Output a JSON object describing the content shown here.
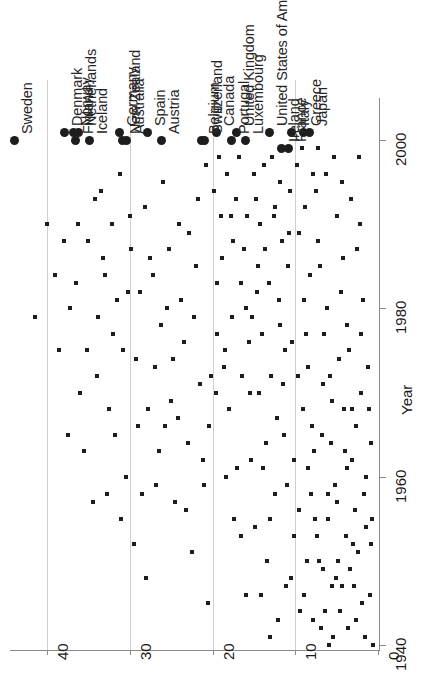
{
  "chart_data": {
    "type": "scatter",
    "title": "",
    "xlabel": "Year",
    "ylabel": "",
    "orientation": "rotated-90",
    "grid": true,
    "legend": null,
    "axes": {
      "value_axis": {
        "name": "value",
        "ticks": [
          "40",
          "30",
          "20",
          "10",
          "0"
        ],
        "tick_values": [
          40,
          30,
          20,
          10,
          0
        ],
        "range": [
          0,
          44
        ]
      },
      "year_axis": {
        "name": "Year",
        "label": "Year",
        "ticks": [
          "2000",
          "1940",
          "1960",
          "1980"
        ],
        "tick_values": [
          1940,
          1960,
          1980,
          2000
        ],
        "range": [
          1936,
          2005
        ]
      }
    },
    "marker_styles": {
      "historical": "small-square",
      "latest": "large-filled-circle"
    },
    "labeled_points": [
      {
        "label": "Sweden",
        "value": 44.0,
        "year": 2000
      },
      {
        "label": "Denmark",
        "value": 38.0,
        "year": 2001
      },
      {
        "label": "Norway",
        "value": 36.8,
        "year": 2001
      },
      {
        "label": "Netherlands",
        "value": 36.2,
        "year": 2001
      },
      {
        "label": "Finland",
        "value": 36.6,
        "year": 2000
      },
      {
        "label": "Iceland",
        "value": 34.9,
        "year": 2000
      },
      {
        "label": "Germany",
        "value": 31.3,
        "year": 2001
      },
      {
        "label": "New Zealand",
        "value": 30.9,
        "year": 2000
      },
      {
        "label": "Australia",
        "value": 30.5,
        "year": 2000
      },
      {
        "label": "Spain",
        "value": 27.9,
        "year": 2001
      },
      {
        "label": "Austria",
        "value": 26.2,
        "year": 2000
      },
      {
        "label": "Belgium",
        "value": 21.4,
        "year": 2000
      },
      {
        "label": "Switzerland",
        "value": 21.0,
        "year": 2000
      },
      {
        "label": "Canada",
        "value": 19.6,
        "year": 2001
      },
      {
        "label": "Portugal",
        "value": 17.8,
        "year": 2000
      },
      {
        "label": "United Kingdom",
        "value": 17.2,
        "year": 2001
      },
      {
        "label": "Luxembourg",
        "value": 16.1,
        "year": 2000
      },
      {
        "label": "United States of America",
        "value": 13.2,
        "year": 2001
      },
      {
        "label": "Ireland",
        "value": 11.7,
        "year": 1999
      },
      {
        "label": "France",
        "value": 10.9,
        "year": 1999
      },
      {
        "label": "Italy",
        "value": 10.5,
        "year": 2001
      },
      {
        "label": "Greece",
        "value": 9.1,
        "year": 2001
      },
      {
        "label": "Japan",
        "value": 8.3,
        "year": 2001
      }
    ],
    "historical_points": [
      [
        41.5,
        1979
      ],
      [
        38.5,
        1975
      ],
      [
        37.5,
        1965
      ],
      [
        36.0,
        1970
      ],
      [
        35.5,
        1963
      ],
      [
        34.5,
        1957
      ],
      [
        33.0,
        1984
      ],
      [
        32.5,
        1968
      ],
      [
        31.5,
        1981
      ],
      [
        30.5,
        1960
      ],
      [
        29.5,
        1952
      ],
      [
        38.0,
        1988
      ],
      [
        36.5,
        1983
      ],
      [
        35.0,
        1988
      ],
      [
        34.0,
        1972
      ],
      [
        33.5,
        1994
      ],
      [
        32.0,
        1977
      ],
      [
        31.0,
        1955
      ],
      [
        30.0,
        1991
      ],
      [
        29.0,
        1966
      ],
      [
        28.5,
        1958
      ],
      [
        28.0,
        1948
      ],
      [
        27.5,
        1986
      ],
      [
        27.0,
        1973
      ],
      [
        26.5,
        1963
      ],
      [
        26.0,
        1995
      ],
      [
        25.5,
        1980
      ],
      [
        25.0,
        1969
      ],
      [
        24.5,
        1957
      ],
      [
        24.0,
        1990
      ],
      [
        23.5,
        1976
      ],
      [
        23.0,
        1964
      ],
      [
        22.5,
        1951
      ],
      [
        22.0,
        1985
      ],
      [
        21.5,
        1971
      ],
      [
        21.0,
        1959
      ],
      [
        20.5,
        1945
      ],
      [
        34.2,
        1993
      ],
      [
        33.2,
        1986
      ],
      [
        32.2,
        1990
      ],
      [
        31.2,
        1996
      ],
      [
        30.2,
        1982
      ],
      [
        29.2,
        1974
      ],
      [
        28.2,
        1992
      ],
      [
        27.2,
        1984
      ],
      [
        26.2,
        1978
      ],
      [
        25.2,
        1987
      ],
      [
        24.2,
        1967
      ],
      [
        23.2,
        1956
      ],
      [
        22.2,
        1979
      ],
      [
        21.2,
        1962
      ],
      [
        20.2,
        1972
      ],
      [
        19.8,
        1994
      ],
      [
        19.5,
        1983
      ],
      [
        19.0,
        1991
      ],
      [
        18.5,
        1975
      ],
      [
        18.0,
        1968
      ],
      [
        17.5,
        1988
      ],
      [
        17.0,
        1961
      ],
      [
        16.5,
        1953
      ],
      [
        16.0,
        1980
      ],
      [
        15.5,
        1970
      ],
      [
        15.0,
        1996
      ],
      [
        14.5,
        1985
      ],
      [
        14.0,
        1977
      ],
      [
        13.5,
        1964
      ],
      [
        13.0,
        1955
      ],
      [
        12.5,
        1992
      ],
      [
        12.0,
        1981
      ],
      [
        11.5,
        1971
      ],
      [
        11.0,
        1959
      ],
      [
        10.5,
        1948
      ],
      [
        19.2,
        1998
      ],
      [
        18.2,
        1996
      ],
      [
        17.2,
        1993
      ],
      [
        16.2,
        1987
      ],
      [
        15.2,
        1979
      ],
      [
        14.2,
        1990
      ],
      [
        13.2,
        1983
      ],
      [
        12.2,
        1967
      ],
      [
        11.2,
        1975
      ],
      [
        10.2,
        1962
      ],
      [
        9.8,
        1997
      ],
      [
        9.5,
        1989
      ],
      [
        9.0,
        1981
      ],
      [
        8.5,
        1973
      ],
      [
        8.0,
        1966
      ],
      [
        7.5,
        1994
      ],
      [
        7.0,
        1985
      ],
      [
        6.5,
        1977
      ],
      [
        6.0,
        1958
      ],
      [
        5.5,
        1969
      ],
      [
        5.0,
        1991
      ],
      [
        4.5,
        1982
      ],
      [
        4.0,
        1963
      ],
      [
        3.5,
        1975
      ],
      [
        3.0,
        1952
      ],
      [
        2.5,
        1987
      ],
      [
        2.0,
        1970
      ],
      [
        1.5,
        1960
      ],
      [
        1.0,
        1946
      ],
      [
        9.2,
        1999
      ],
      [
        8.8,
        1992
      ],
      [
        8.2,
        1984
      ],
      [
        7.8,
        1996
      ],
      [
        7.2,
        1988
      ],
      [
        6.8,
        1965
      ],
      [
        6.2,
        1980
      ],
      [
        5.8,
        1972
      ],
      [
        5.2,
        1959
      ],
      [
        4.8,
        1950
      ],
      [
        4.2,
        1986
      ],
      [
        3.8,
        1978
      ],
      [
        3.2,
        1968
      ],
      [
        2.8,
        1956
      ],
      [
        2.2,
        1990
      ],
      [
        1.8,
        1981
      ],
      [
        1.2,
        1973
      ],
      [
        0.8,
        1964
      ],
      [
        9.6,
        1956
      ],
      [
        8.6,
        1950
      ],
      [
        7.6,
        1955
      ],
      [
        6.6,
        1949
      ],
      [
        5.6,
        1947
      ],
      [
        4.6,
        1944
      ],
      [
        3.6,
        1942
      ],
      [
        2.6,
        1943
      ],
      [
        1.6,
        1941
      ],
      [
        0.6,
        1940
      ],
      [
        8.4,
        1961
      ],
      [
        7.4,
        1953
      ],
      [
        6.4,
        1944
      ],
      [
        5.4,
        1941
      ],
      [
        4.4,
        1947
      ],
      [
        3.4,
        1949
      ],
      [
        2.4,
        1951
      ],
      [
        1.4,
        1954
      ],
      [
        9.4,
        1944
      ],
      [
        8.9,
        1946
      ],
      [
        7.9,
        1943
      ],
      [
        6.9,
        1942
      ],
      [
        5.9,
        1940
      ],
      [
        4.9,
        1957
      ],
      [
        3.9,
        1953
      ],
      [
        2.9,
        1947
      ],
      [
        1.9,
        1945
      ],
      [
        12.8,
        1998
      ],
      [
        11.8,
        1995
      ],
      [
        10.8,
        1989
      ],
      [
        13.8,
        1997
      ],
      [
        14.8,
        1993
      ],
      [
        15.8,
        1991
      ],
      [
        16.8,
        1998
      ],
      [
        17.8,
        1991
      ],
      [
        18.8,
        1986
      ],
      [
        20.8,
        1997
      ],
      [
        21.8,
        1993
      ],
      [
        22.8,
        1989
      ],
      [
        23.8,
        1981
      ],
      [
        24.8,
        1974
      ],
      [
        25.8,
        1966
      ],
      [
        26.8,
        1959
      ],
      [
        27.8,
        1968
      ],
      [
        28.8,
        1982
      ],
      [
        29.8,
        1987
      ],
      [
        30.8,
        1975
      ],
      [
        31.8,
        1965
      ],
      [
        32.8,
        1958
      ],
      [
        33.8,
        1979
      ],
      [
        35.2,
        1975
      ],
      [
        36.2,
        1990
      ],
      [
        37.2,
        1980
      ],
      [
        39.0,
        1984
      ],
      [
        40.0,
        1990
      ],
      [
        10.4,
        1976
      ],
      [
        11.4,
        1965
      ],
      [
        12.4,
        1958
      ],
      [
        13.4,
        1950
      ],
      [
        14.4,
        1970
      ],
      [
        15.4,
        1962
      ],
      [
        16.4,
        1972
      ],
      [
        17.4,
        1955
      ],
      [
        18.4,
        1960
      ],
      [
        19.4,
        1977
      ],
      [
        20.4,
        1966
      ],
      [
        9.1,
        1968
      ],
      [
        8.1,
        1958
      ],
      [
        7.1,
        1950
      ],
      [
        6.1,
        1955
      ],
      [
        5.1,
        1948
      ],
      [
        4.1,
        1968
      ],
      [
        3.1,
        1962
      ],
      [
        2.1,
        1977
      ],
      [
        1.1,
        1968
      ],
      [
        0.9,
        1952
      ],
      [
        10.1,
        1953
      ],
      [
        11.1,
        1947
      ],
      [
        12.1,
        1943
      ],
      [
        13.1,
        1941
      ],
      [
        14.1,
        1946
      ],
      [
        10.9,
        1985
      ],
      [
        11.9,
        1978
      ],
      [
        12.9,
        1972
      ],
      [
        13.9,
        1961
      ],
      [
        14.9,
        1954
      ],
      [
        15.9,
        1946
      ],
      [
        6.3,
        1996
      ],
      [
        7.3,
        1999
      ],
      [
        5.3,
        1998
      ],
      [
        4.3,
        1995
      ],
      [
        3.3,
        1993
      ],
      [
        2.3,
        1998
      ],
      [
        8.7,
        1977
      ],
      [
        9.7,
        1972
      ],
      [
        7.7,
        1963
      ],
      [
        6.7,
        1971
      ],
      [
        5.7,
        1964
      ],
      [
        4.7,
        1974
      ],
      [
        3.7,
        1961
      ],
      [
        2.7,
        1966
      ],
      [
        1.7,
        1958
      ],
      [
        0.7,
        1955
      ],
      [
        10.6,
        1994
      ],
      [
        11.6,
        1988
      ],
      [
        12.6,
        1991
      ],
      [
        13.6,
        1987
      ],
      [
        14.6,
        1982
      ],
      [
        15.6,
        1976
      ],
      [
        16.6,
        1983
      ],
      [
        17.6,
        1979
      ],
      [
        18.6,
        1973
      ],
      [
        19.6,
        1970
      ]
    ]
  }
}
